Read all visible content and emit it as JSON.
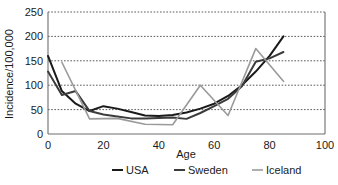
{
  "chart_data": {
    "type": "line",
    "title": "",
    "xlabel": "Age",
    "ylabel": "Incidence/100,000",
    "xlim": [
      0,
      100
    ],
    "ylim": [
      0,
      250
    ],
    "xticks": [
      0,
      20,
      40,
      60,
      80,
      100
    ],
    "yticks": [
      0,
      50,
      100,
      150,
      200,
      250
    ],
    "xtick_labels": [
      "0",
      "20",
      "40",
      "60",
      "80",
      "100"
    ],
    "ytick_labels": [
      "0",
      "50",
      "100",
      "150",
      "200",
      "250"
    ],
    "grid": "horizontal-dotted",
    "legend_position": "bottom",
    "series": [
      {
        "name": "USA",
        "color": "#1a1a1a",
        "width": 2.0,
        "x": [
          0,
          5,
          10,
          15,
          20,
          25,
          30,
          35,
          40,
          45,
          50,
          55,
          60,
          65,
          70,
          75,
          80,
          85
        ],
        "values": [
          160,
          88,
          62,
          47,
          57,
          52,
          45,
          38,
          37,
          39,
          44,
          52,
          62,
          78,
          100,
          128,
          160,
          200
        ]
      },
      {
        "name": "Sweden",
        "color": "#3c3c3c",
        "width": 2.0,
        "x": [
          0,
          5,
          10,
          15,
          20,
          25,
          30,
          35,
          40,
          45,
          50,
          55,
          60,
          65,
          70,
          75,
          80,
          85
        ],
        "values": [
          128,
          80,
          88,
          47,
          40,
          36,
          32,
          32,
          33,
          34,
          31,
          43,
          57,
          72,
          98,
          148,
          155,
          168
        ]
      },
      {
        "name": "Iceland",
        "color": "#9a9a9a",
        "width": 1.6,
        "x": [
          5,
          15,
          25,
          35,
          45,
          55,
          65,
          75,
          85
        ],
        "values": [
          147,
          31,
          32,
          20,
          19,
          100,
          38,
          175,
          108
        ]
      }
    ]
  },
  "legend": {
    "items": [
      {
        "label": "USA",
        "color": "#1a1a1a"
      },
      {
        "label": "Sweden",
        "color": "#3c3c3c"
      },
      {
        "label": "Iceland",
        "color": "#9a9a9a"
      }
    ]
  }
}
